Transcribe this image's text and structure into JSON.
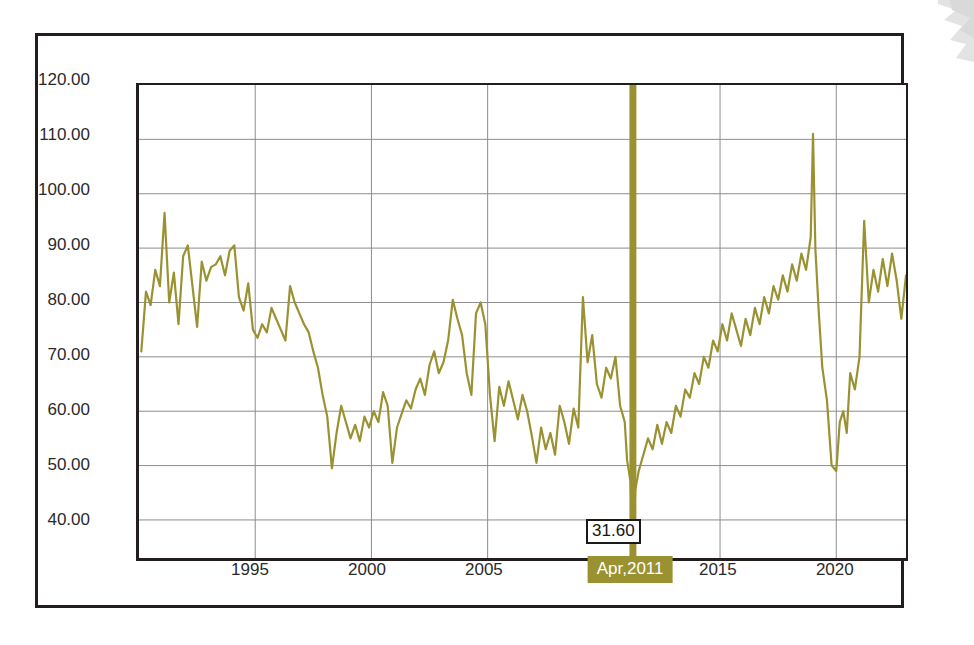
{
  "chart_data": {
    "type": "line",
    "title": "",
    "subtitle": "",
    "xlabel": "",
    "ylabel": "",
    "ylim": [
      33.0,
      120.0
    ],
    "xlim": [
      1990.0,
      2023.0
    ],
    "grid": true,
    "legend": false,
    "legend_position": "none",
    "y_ticks": [
      "120.00",
      "110.00",
      "100.00",
      "90.00",
      "80.00",
      "70.00",
      "60.00",
      "50.00",
      "40.00"
    ],
    "y_tick_values": [
      120,
      110,
      100,
      90,
      80,
      70,
      60,
      50,
      40
    ],
    "x_ticks": [
      "1995",
      "2000",
      "2005",
      "Apr,2011",
      "2015",
      "2020"
    ],
    "x_tick_values": [
      1995,
      2000,
      2005,
      2011.25,
      2015,
      2020
    ],
    "series_color": "#9a9131",
    "marker": {
      "label": "Apr,2011",
      "value": "31.60",
      "x": 2011.25,
      "color": "#9a9131"
    },
    "series": [
      {
        "name": "series-1",
        "x": [
          1990.1,
          1990.3,
          1990.5,
          1990.7,
          1990.9,
          1991.1,
          1991.3,
          1991.5,
          1991.7,
          1991.9,
          1992.1,
          1992.3,
          1992.5,
          1992.7,
          1992.9,
          1993.1,
          1993.3,
          1993.5,
          1993.7,
          1993.9,
          1994.1,
          1994.3,
          1994.5,
          1994.7,
          1994.9,
          1995.1,
          1995.3,
          1995.5,
          1995.7,
          1995.9,
          1996.1,
          1996.3,
          1996.5,
          1996.7,
          1996.9,
          1997.1,
          1997.3,
          1997.5,
          1997.7,
          1997.9,
          1998.1,
          1998.3,
          1998.5,
          1998.7,
          1998.9,
          1999.1,
          1999.3,
          1999.5,
          1999.7,
          1999.9,
          2000.1,
          2000.3,
          2000.5,
          2000.7,
          2000.9,
          2001.1,
          2001.3,
          2001.5,
          2001.7,
          2001.9,
          2002.1,
          2002.3,
          2002.5,
          2002.7,
          2002.9,
          2003.1,
          2003.3,
          2003.5,
          2003.7,
          2003.9,
          2004.1,
          2004.3,
          2004.5,
          2004.7,
          2004.9,
          2005.1,
          2005.3,
          2005.5,
          2005.7,
          2005.9,
          2006.1,
          2006.3,
          2006.5,
          2006.7,
          2006.9,
          2007.1,
          2007.3,
          2007.5,
          2007.7,
          2007.9,
          2008.1,
          2008.3,
          2008.5,
          2008.7,
          2008.9,
          2009.1,
          2009.3,
          2009.5,
          2009.7,
          2009.9,
          2010.1,
          2010.3,
          2010.5,
          2010.7,
          2010.9,
          2011.0,
          2011.15,
          2011.25,
          2011.35,
          2011.5,
          2011.7,
          2011.9,
          2012.1,
          2012.3,
          2012.5,
          2012.7,
          2012.9,
          2013.1,
          2013.3,
          2013.5,
          2013.7,
          2013.9,
          2014.1,
          2014.3,
          2014.5,
          2014.7,
          2014.9,
          2015.1,
          2015.3,
          2015.5,
          2015.7,
          2015.9,
          2016.1,
          2016.3,
          2016.5,
          2016.7,
          2016.9,
          2017.1,
          2017.3,
          2017.5,
          2017.7,
          2017.9,
          2018.1,
          2018.3,
          2018.5,
          2018.7,
          2018.9,
          2019.0,
          2019.1,
          2019.25,
          2019.4,
          2019.6,
          2019.8,
          2020.0,
          2020.15,
          2020.3,
          2020.45,
          2020.6,
          2020.8,
          2021.0,
          2021.2,
          2021.4,
          2021.6,
          2021.8,
          2022.0,
          2022.2,
          2022.4,
          2022.6,
          2022.8,
          2023.0
        ],
        "values": [
          71.0,
          82.0,
          79.5,
          86.0,
          83.0,
          96.5,
          80.0,
          85.5,
          76.0,
          88.5,
          90.5,
          83.0,
          75.5,
          87.5,
          84.0,
          86.5,
          87.0,
          88.5,
          85.0,
          89.5,
          90.5,
          81.0,
          78.5,
          83.5,
          75.0,
          73.5,
          76.0,
          74.5,
          79.0,
          77.0,
          75.0,
          73.0,
          83.0,
          80.0,
          78.0,
          76.0,
          74.5,
          71.0,
          68.0,
          63.0,
          59.0,
          49.5,
          56.0,
          61.0,
          58.0,
          55.0,
          57.5,
          54.5,
          59.0,
          57.0,
          60.0,
          58.0,
          63.5,
          61.0,
          50.5,
          57.0,
          59.5,
          62.0,
          60.5,
          64.0,
          66.0,
          63.0,
          68.5,
          71.0,
          67.0,
          69.0,
          73.0,
          80.5,
          77.0,
          74.0,
          67.0,
          63.0,
          78.0,
          80.0,
          76.0,
          63.0,
          54.5,
          64.5,
          61.0,
          65.5,
          62.0,
          58.5,
          63.0,
          60.0,
          55.5,
          50.5,
          57.0,
          53.0,
          56.0,
          52.0,
          61.0,
          58.0,
          54.0,
          60.5,
          57.0,
          81.0,
          69.0,
          74.0,
          65.0,
          62.5,
          68.0,
          66.0,
          70.0,
          61.0,
          58.0,
          51.0,
          47.0,
          31.6,
          45.5,
          49.0,
          52.0,
          55.0,
          53.0,
          57.5,
          54.0,
          58.0,
          56.0,
          61.0,
          59.0,
          64.0,
          62.5,
          67.0,
          65.0,
          70.0,
          68.0,
          73.0,
          71.0,
          76.0,
          73.0,
          78.0,
          75.0,
          72.0,
          77.0,
          74.0,
          79.0,
          76.0,
          81.0,
          78.0,
          83.0,
          80.5,
          85.0,
          82.0,
          87.0,
          84.0,
          89.0,
          86.0,
          92.0,
          111.0,
          90.0,
          78.0,
          68.0,
          62.0,
          50.0,
          49.0,
          58.0,
          60.0,
          56.0,
          67.0,
          64.0,
          70.0,
          95.0,
          80.0,
          86.0,
          82.0,
          88.0,
          83.0,
          89.0,
          84.0,
          77.0,
          85.0
        ]
      }
    ]
  },
  "decorations": {
    "corner_shape": "zigzag-arrow-decoration"
  }
}
